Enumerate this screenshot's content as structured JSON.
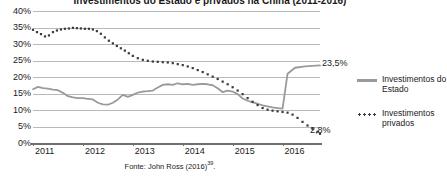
{
  "chart_data": {
    "type": "line",
    "title": "Investimentos do Estado e privados na China (2011-2016)",
    "xlabel": "",
    "ylabel": "",
    "ylim": [
      0,
      40
    ],
    "ytick_labels": [
      "40%",
      "35%",
      "30%",
      "25%",
      "20%",
      "15%",
      "10%",
      "5%",
      "0%"
    ],
    "ytick_values": [
      40,
      35,
      30,
      25,
      20,
      15,
      10,
      5,
      0
    ],
    "xtick_labels": [
      "2011",
      "2012",
      "2013",
      "2014",
      "2015",
      "2016"
    ],
    "xlim": [
      2011.0,
      2016.75
    ],
    "grid": true,
    "legend_position": "right",
    "series": [
      {
        "name": "Investimentos do Estado",
        "style": "solid",
        "color": "#9a9a9a",
        "end_label": "23,5%",
        "x": [
          2011.0,
          2011.1,
          2011.2,
          2011.3,
          2011.4,
          2011.5,
          2011.6,
          2011.7,
          2011.8,
          2011.9,
          2012.0,
          2012.1,
          2012.2,
          2012.3,
          2012.4,
          2012.5,
          2012.6,
          2012.7,
          2012.8,
          2012.9,
          2013.0,
          2013.1,
          2013.2,
          2013.3,
          2013.4,
          2013.5,
          2013.6,
          2013.7,
          2013.8,
          2013.9,
          2014.0,
          2014.1,
          2014.2,
          2014.3,
          2014.4,
          2014.5,
          2014.6,
          2014.7,
          2014.8,
          2014.9,
          2015.0,
          2015.1,
          2015.2,
          2015.3,
          2015.4,
          2015.5,
          2015.6,
          2015.7,
          2015.8,
          2015.9,
          2015.95,
          2016.0,
          2016.1,
          2016.25,
          2016.45,
          2016.6,
          2016.75
        ],
        "y": [
          16.3,
          17.0,
          16.6,
          16.5,
          16.2,
          16.0,
          15.2,
          14.2,
          13.8,
          13.6,
          13.6,
          13.4,
          13.2,
          12.2,
          11.7,
          11.6,
          12.2,
          13.2,
          14.6,
          14.0,
          14.6,
          15.3,
          15.6,
          15.7,
          15.9,
          16.8,
          17.6,
          17.8,
          17.6,
          18.1,
          17.8,
          17.9,
          17.6,
          17.8,
          17.9,
          17.8,
          17.5,
          16.6,
          15.4,
          15.9,
          15.6,
          14.8,
          13.5,
          12.8,
          12.3,
          11.9,
          11.4,
          11.1,
          10.8,
          10.6,
          10.5,
          10.4,
          21.0,
          22.8,
          23.2,
          23.4,
          23.5
        ]
      },
      {
        "name": "Investimentos privados",
        "style": "dotted",
        "color": "#3a3a3a",
        "end_label": "2,8%",
        "x": [
          2011.0,
          2011.08,
          2011.16,
          2011.24,
          2011.32,
          2011.4,
          2011.48,
          2011.56,
          2011.64,
          2011.72,
          2011.8,
          2011.88,
          2011.96,
          2012.04,
          2012.12,
          2012.2,
          2012.28,
          2012.36,
          2012.44,
          2012.52,
          2012.6,
          2012.68,
          2012.76,
          2012.84,
          2012.92,
          2013.0,
          2013.1,
          2013.2,
          2013.3,
          2013.4,
          2013.5,
          2013.6,
          2013.7,
          2013.8,
          2013.9,
          2014.0,
          2014.1,
          2014.2,
          2014.3,
          2014.4,
          2014.5,
          2014.6,
          2014.7,
          2014.8,
          2014.9,
          2015.0,
          2015.1,
          2015.2,
          2015.3,
          2015.4,
          2015.5,
          2015.6,
          2015.7,
          2015.8,
          2015.9,
          2016.0,
          2016.1,
          2016.2,
          2016.3,
          2016.4,
          2016.5,
          2016.6,
          2016.7,
          2016.75
        ],
        "y": [
          34.3,
          33.6,
          33.0,
          32.3,
          32.6,
          33.6,
          34.1,
          34.4,
          34.6,
          34.7,
          34.9,
          34.8,
          34.7,
          34.6,
          34.6,
          34.4,
          33.9,
          33.1,
          32.0,
          31.0,
          30.2,
          29.4,
          28.7,
          28.0,
          27.2,
          26.4,
          25.7,
          25.2,
          24.9,
          24.7,
          24.6,
          24.5,
          24.4,
          24.2,
          23.9,
          23.6,
          23.2,
          22.7,
          22.1,
          21.5,
          20.8,
          20.1,
          19.4,
          18.6,
          17.8,
          16.9,
          15.9,
          14.8,
          13.6,
          12.5,
          11.5,
          10.6,
          10.1,
          9.8,
          9.6,
          9.4,
          9.2,
          8.6,
          7.6,
          6.4,
          5.3,
          4.3,
          3.4,
          2.8
        ]
      }
    ],
    "annotations": [
      "23,5%",
      "2,8%"
    ],
    "source": "Fonte: John Ross (2016)",
    "source_note": "39"
  }
}
